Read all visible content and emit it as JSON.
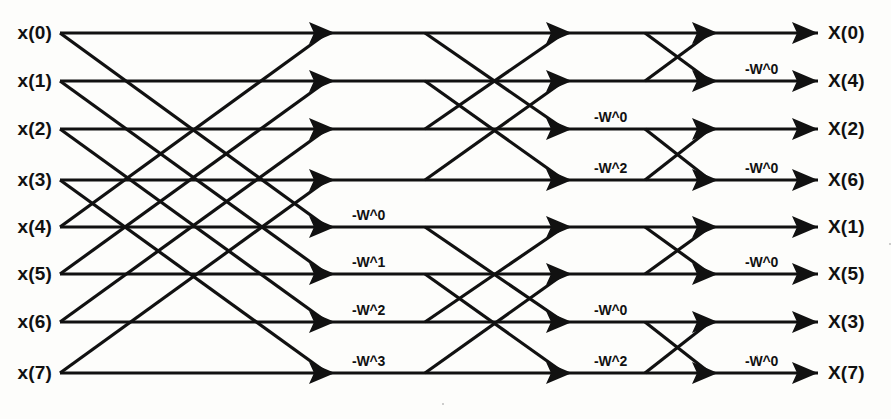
{
  "diagram": {
    "type": "fft-butterfly",
    "stages": 3,
    "points": 8,
    "line_color": "#111111",
    "background_color": "#fdfdfb"
  },
  "inputs": [
    {
      "label": "x(0)",
      "row": 0
    },
    {
      "label": "x(1)",
      "row": 1
    },
    {
      "label": "x(2)",
      "row": 2
    },
    {
      "label": "x(3)",
      "row": 3
    },
    {
      "label": "x(4)",
      "row": 4
    },
    {
      "label": "x(5)",
      "row": 5
    },
    {
      "label": "x(6)",
      "row": 6
    },
    {
      "label": "x(7)",
      "row": 7
    }
  ],
  "outputs": [
    {
      "label": "X(0)",
      "row": 0
    },
    {
      "label": "X(4)",
      "row": 1
    },
    {
      "label": "X(2)",
      "row": 2
    },
    {
      "label": "X(6)",
      "row": 3
    },
    {
      "label": "X(1)",
      "row": 4
    },
    {
      "label": "X(5)",
      "row": 5
    },
    {
      "label": "X(3)",
      "row": 6
    },
    {
      "label": "X(7)",
      "row": 7
    }
  ],
  "twiddle_labels": [
    {
      "text": "-W^0",
      "stage": 1,
      "row": 4,
      "x": 352
    },
    {
      "text": "-W^1",
      "stage": 1,
      "row": 5,
      "x": 352
    },
    {
      "text": "-W^2",
      "stage": 1,
      "row": 6,
      "x": 352
    },
    {
      "text": "-W^3",
      "stage": 1,
      "row": 7,
      "x": 352
    },
    {
      "text": "-W^0",
      "stage": 2,
      "row": 2,
      "x": 594
    },
    {
      "text": "-W^2",
      "stage": 2,
      "row": 3,
      "x": 594
    },
    {
      "text": "-W^0",
      "stage": 2,
      "row": 6,
      "x": 594
    },
    {
      "text": "-W^2",
      "stage": 2,
      "row": 7,
      "x": 594
    },
    {
      "text": "-W^0",
      "stage": 3,
      "row": 1,
      "x": 745
    },
    {
      "text": "-W^0",
      "stage": 3,
      "row": 3,
      "x": 745
    },
    {
      "text": "-W^0",
      "stage": 3,
      "row": 5,
      "x": 745
    },
    {
      "text": "-W^0",
      "stage": 3,
      "row": 7,
      "x": 745
    }
  ],
  "geometry": {
    "row_y": [
      33,
      81,
      129,
      180,
      227,
      274,
      322,
      373
    ],
    "x_input_label": 52,
    "x_node_start": 60,
    "x_stage1_arrow": 335,
    "x_stage2_branch": 425,
    "x_stage2_arrow": 572,
    "x_stage3_branch": 645,
    "x_stage3_arrow": 718,
    "x_output_arrow": 818,
    "x_output_label": 828,
    "line_width": 3.2,
    "arrow_length": 26,
    "arrow_half_height": 11
  },
  "butterflies": {
    "stage1_pairs": [
      [
        0,
        4
      ],
      [
        1,
        5
      ],
      [
        2,
        6
      ],
      [
        3,
        7
      ]
    ],
    "stage2_pairs": [
      [
        0,
        2
      ],
      [
        1,
        3
      ],
      [
        4,
        6
      ],
      [
        5,
        7
      ]
    ],
    "stage3_pairs": [
      [
        0,
        1
      ],
      [
        2,
        3
      ],
      [
        4,
        5
      ],
      [
        6,
        7
      ]
    ]
  }
}
